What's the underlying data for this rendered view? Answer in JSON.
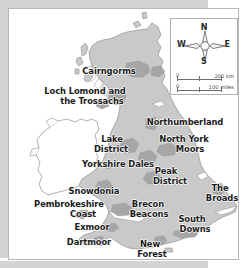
{
  "map": {
    "title": "UK National Parks locator map",
    "colors": {
      "land_fill": "#c9c9c9",
      "park_fill": "#a6a6a6",
      "coastline": "#8f8f8f",
      "ireland_fill": "#ffffff",
      "label_text": "#1b1b1b",
      "frame_border": "#b7b7b7",
      "page_margin": "#d4d4d4"
    },
    "labels": [
      {
        "id": "cairngorms",
        "text": "Cairngorms",
        "x": 100,
        "y": 63,
        "align": "center"
      },
      {
        "id": "loch-lomond-line1",
        "text": "Loch Lomond and",
        "x": 76,
        "y": 83,
        "align": "center"
      },
      {
        "id": "loch-lomond-line2",
        "text": "the Trossachs",
        "x": 83,
        "y": 93,
        "align": "center"
      },
      {
        "id": "northumberland",
        "text": "Northumberland",
        "x": 176,
        "y": 114,
        "align": "center"
      },
      {
        "id": "lake-district-line1",
        "text": "Lake",
        "x": 103,
        "y": 131,
        "align": "center"
      },
      {
        "id": "lake-district-line2",
        "text": "District",
        "x": 102,
        "y": 141,
        "align": "center"
      },
      {
        "id": "north-york-moors-l1",
        "text": "North York",
        "x": 175,
        "y": 131,
        "align": "center"
      },
      {
        "id": "north-york-moors-l2",
        "text": "Moors",
        "x": 181,
        "y": 141,
        "align": "center"
      },
      {
        "id": "yorkshire-dales",
        "text": "Yorkshire Dales",
        "x": 109,
        "y": 156,
        "align": "center"
      },
      {
        "id": "peak-district-line1",
        "text": "Peak",
        "x": 157,
        "y": 163,
        "align": "center"
      },
      {
        "id": "peak-district-line2",
        "text": "District",
        "x": 161,
        "y": 173,
        "align": "center"
      },
      {
        "id": "snowdonia",
        "text": "Snowdonia",
        "x": 85,
        "y": 183,
        "align": "center"
      },
      {
        "id": "the-broads-line1",
        "text": "The",
        "x": 211,
        "y": 180,
        "align": "center"
      },
      {
        "id": "the-broads-line2",
        "text": "Broads",
        "x": 213,
        "y": 190,
        "align": "center"
      },
      {
        "id": "pembrokeshire-line1",
        "text": "Pembrokeshire",
        "x": 60,
        "y": 196,
        "align": "center"
      },
      {
        "id": "pembrokeshire-line2",
        "text": "Coast",
        "x": 74,
        "y": 206,
        "align": "center"
      },
      {
        "id": "brecon-beacons-line1",
        "text": "Brecon",
        "x": 139,
        "y": 196,
        "align": "center"
      },
      {
        "id": "brecon-beacons-line2",
        "text": "Beacons",
        "x": 140,
        "y": 206,
        "align": "center"
      },
      {
        "id": "south-downs-line1",
        "text": "South",
        "x": 183,
        "y": 211,
        "align": "center"
      },
      {
        "id": "south-downs-line2",
        "text": "Downs",
        "x": 186,
        "y": 221,
        "align": "center"
      },
      {
        "id": "exmoor",
        "text": "Exmoor",
        "x": 83,
        "y": 219,
        "align": "center"
      },
      {
        "id": "dartmoor",
        "text": "Dartmoor",
        "x": 80,
        "y": 234,
        "align": "center"
      },
      {
        "id": "new-forest-line1",
        "text": "New",
        "x": 141,
        "y": 236,
        "align": "center"
      },
      {
        "id": "new-forest-line2",
        "text": "Forest",
        "x": 143,
        "y": 246,
        "align": "center"
      }
    ],
    "inset": {
      "compass": {
        "north": "N",
        "south": "S",
        "east": "E",
        "west": "W"
      },
      "scale": {
        "km": {
          "zero": "0",
          "max": "200 km"
        },
        "miles": {
          "zero": "0",
          "max": "100 miles"
        }
      }
    }
  }
}
